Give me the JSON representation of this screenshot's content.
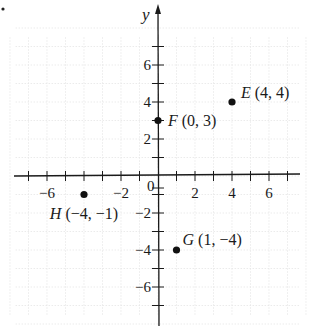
{
  "chart_data": {
    "type": "scatter",
    "title": "",
    "xlabel": "",
    "ylabel": "y",
    "xlim": [
      -8,
      8
    ],
    "ylim": [
      -8,
      8
    ],
    "grid": true,
    "x_tick_labels": [
      -6,
      -2,
      2,
      4,
      6
    ],
    "y_tick_labels": [
      6,
      4,
      2,
      -2,
      -4,
      -6
    ],
    "origin_label": "0",
    "points": [
      {
        "name": "E",
        "x": 4,
        "y": 4,
        "label": "(4, 4)"
      },
      {
        "name": "F",
        "x": 0,
        "y": 3,
        "label": "(0, 3)"
      },
      {
        "name": "G",
        "x": 1,
        "y": -4,
        "label": "(1, -4)"
      },
      {
        "name": "H",
        "x": -4,
        "y": -1,
        "label": "(-4, -1)"
      }
    ]
  },
  "axes": {
    "y_axis_label": "y",
    "origin_label": "0"
  },
  "colors": {
    "axis": "#1a1a1a",
    "grid": "#e6e6e6",
    "point": "#111111",
    "text": "#1a1a1a"
  }
}
